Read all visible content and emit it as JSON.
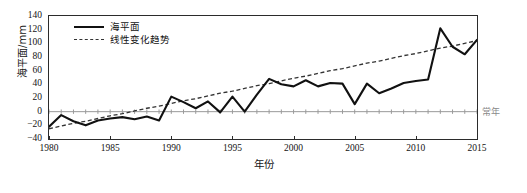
{
  "chart_data": {
    "type": "line",
    "title": "",
    "xlabel": "年份",
    "ylabel": "海平面/mm",
    "xlim": [
      1980,
      2015
    ],
    "ylim": [
      -40,
      140
    ],
    "ytick_labels": [
      "140",
      "120",
      "100",
      "80",
      "60",
      "40",
      "20",
      "0",
      "-20",
      "-40"
    ],
    "yticks": [
      140,
      120,
      100,
      80,
      60,
      40,
      20,
      0,
      -20,
      -40
    ],
    "xtick_labels": [
      "1980",
      "1985",
      "1990",
      "1995",
      "2000",
      "2005",
      "2010",
      "2015"
    ],
    "xticks": [
      1980,
      1985,
      1990,
      1995,
      2000,
      2005,
      2010,
      2015
    ],
    "grid": false,
    "legend_position": "top-left",
    "baseline_label": "常年",
    "baseline_value": 0,
    "x": [
      1980,
      1981,
      1982,
      1983,
      1984,
      1985,
      1986,
      1987,
      1988,
      1989,
      1990,
      1991,
      1992,
      1993,
      1994,
      1995,
      1996,
      1997,
      1998,
      1999,
      2000,
      2001,
      2002,
      2003,
      2004,
      2005,
      2006,
      2007,
      2008,
      2009,
      2010,
      2011,
      2012,
      2013,
      2014,
      2015
    ],
    "series": [
      {
        "name": "海平面",
        "style": "solid",
        "color": "#111111",
        "values": [
          -22,
          -5,
          -14,
          -20,
          -13,
          -10,
          -8,
          -11,
          -7,
          -13,
          22,
          14,
          5,
          15,
          -1,
          22,
          0,
          25,
          48,
          40,
          37,
          46,
          37,
          42,
          41,
          11,
          41,
          27,
          34,
          42,
          45,
          47,
          122,
          95,
          84,
          105
        ]
      },
      {
        "name": "线性变化趋势",
        "style": "dashed",
        "color": "#333333",
        "values": [
          -25,
          -21,
          -17,
          -14,
          -10,
          -6,
          -3,
          1,
          5,
          8,
          12,
          16,
          19,
          23,
          27,
          30,
          34,
          38,
          41,
          45,
          49,
          52,
          56,
          60,
          63,
          67,
          71,
          74,
          78,
          82,
          85,
          89,
          93,
          96,
          100,
          104
        ]
      }
    ]
  },
  "legend": {
    "items": [
      {
        "label": "海平面",
        "style": "solid"
      },
      {
        "label": "线性变化趋势",
        "style": "dashed"
      }
    ]
  },
  "axes": {
    "y_title": "海平面/mm",
    "x_title": "年份"
  },
  "annotations": {
    "baseline": "常年"
  }
}
